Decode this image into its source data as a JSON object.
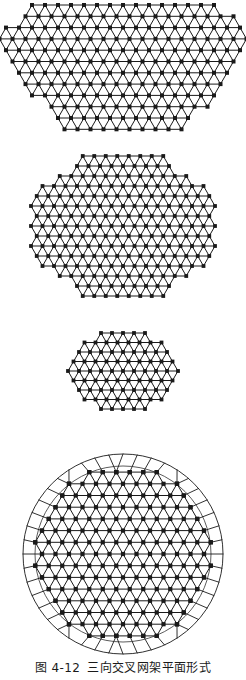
{
  "page": {
    "background": "#ffffff",
    "ink_color": "#1a1a1a",
    "width": 246,
    "height": 680
  },
  "caption": {
    "number": "图 4-12",
    "title": "三向交叉网架平面形式",
    "full_text": "图 4-12  三向交叉网架平面形式"
  },
  "figures": [
    {
      "id": "trapezoid",
      "name": "三向网格梯形平面",
      "shape": "trapezoid",
      "description": "Three-way triangular grid truss, trapezoidal plan, wide top edge with chamfered lower corners",
      "grid": {
        "type": "triangular-three-way",
        "directions": 3,
        "cell_width": 13.0,
        "cell_height": 11.3,
        "columns": 19,
        "rows": 12,
        "node_marker": "filled-square",
        "node_size": 2.0,
        "line_width": 1.0
      },
      "outline": {
        "top_y": 5,
        "bottom_y": 139,
        "top_left_x": 28,
        "top_right_x": 219,
        "bottom_left_x": 61,
        "bottom_right_x": 186,
        "widest_left_x": -8,
        "widest_right_x": 255,
        "widest_y": 34
      }
    },
    {
      "id": "octagon",
      "name": "三向网格八边形平面",
      "shape": "octagon",
      "description": "Three-way triangular grid truss, octagonal plan with chamfered corners",
      "grid": {
        "type": "triangular-three-way",
        "directions": 3,
        "cell_width": 11.5,
        "cell_height": 10.0,
        "columns": 16,
        "rows": 14,
        "node_marker": "filled-square",
        "node_size": 1.9,
        "line_width": 1.0
      },
      "outline": {
        "center_x": 123,
        "center_y": 226,
        "radius_x": 96,
        "radius_y": 72,
        "chamfer": 0.41
      }
    },
    {
      "id": "hexagon",
      "name": "三向网格六边形平面",
      "shape": "hexagon",
      "description": "Three-way triangular grid truss, regular hexagonal plan, flat top and bottom",
      "grid": {
        "type": "triangular-three-way",
        "directions": 3,
        "cell_width": 11.0,
        "cell_height": 9.5,
        "columns": 11,
        "rows": 8,
        "node_marker": "filled-square",
        "node_size": 1.9,
        "line_width": 1.0
      },
      "outline": {
        "center_x": 123,
        "center_y": 371,
        "radius_x": 56,
        "radius_y": 38
      }
    },
    {
      "id": "circle",
      "name": "三向网格圆形平面",
      "shape": "circle",
      "description": "Three-way triangular grid truss, circular plan with radial perimeter ring members",
      "grid": {
        "type": "triangular-three-way",
        "directions": 3,
        "cell_width": 13.5,
        "cell_height": 11.7,
        "columns": 15,
        "rows": 17,
        "node_marker": "filled-square",
        "node_size": 2.1,
        "line_width": 1.0
      },
      "outline": {
        "center_x": 123,
        "center_y": 554,
        "radius": 100,
        "inner_radius": 88,
        "ring_segments": 44,
        "ring_line_width": 0.9
      }
    }
  ]
}
